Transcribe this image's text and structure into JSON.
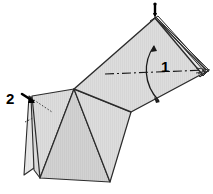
{
  "figure": {
    "type": "paper-folding-instruction",
    "background_color": "#ffffff",
    "paper_fill": "#dcdcdc",
    "paper_fill_light": "#e6e6e6",
    "paper_fill_shadow": "#d0d0d0",
    "stroke_color": "#2b2b2b",
    "labels": [
      {
        "name": "step-number-1",
        "text": "1",
        "x": 161,
        "y": 66,
        "font_size": 15
      },
      {
        "name": "step-number-2",
        "text": "2",
        "x": 8,
        "y": 103,
        "font_size": 15
      }
    ],
    "annotations": {
      "axis_line": {
        "name": "fold-axis-dash-dot-line",
        "style": "dash-dot",
        "x1": 105,
        "y1": 75,
        "x2": 206,
        "y2": 70
      },
      "rotation_arrow": {
        "name": "double-headed-curved-arrow",
        "label": "1",
        "description": "curved double-headed arrow indicating fold direction"
      },
      "pointer_top": {
        "name": "apex-pointer-marker",
        "description": "small black pointer at top apex"
      },
      "pointer_left": {
        "name": "flap-pointer-marker-2",
        "label": "2",
        "description": "small black arrow pointing to left flap corner"
      },
      "hidden_fold": {
        "name": "hidden-edge-dotted-line",
        "style": "dotted",
        "description": "dotted line showing hidden fold inside left flap"
      }
    }
  }
}
